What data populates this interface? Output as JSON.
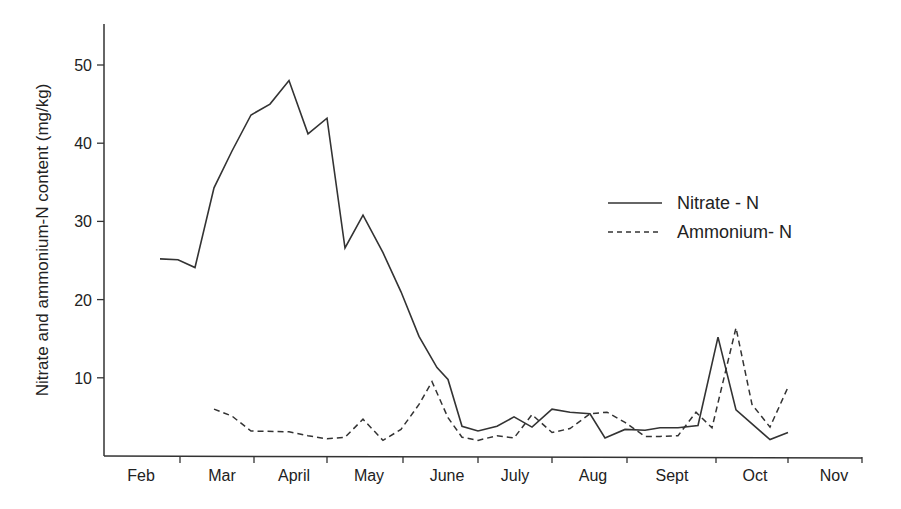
{
  "chart_data": {
    "type": "line",
    "title": "",
    "xlabel": "",
    "ylabel": "Nitrate and ammonium-N content (mg/kg)",
    "ylim": [
      0,
      55
    ],
    "yticks": [
      10,
      20,
      30,
      40,
      50
    ],
    "grid": false,
    "legend_position": "upper right (inside plot)",
    "x_month_labels": [
      "Feb",
      "Mar",
      "April",
      "May",
      "June",
      "July",
      "Aug",
      "Sept",
      "Oct",
      "Nov"
    ],
    "x_month_label_positions_px": [
      141,
      222,
      294,
      369,
      447,
      515,
      593,
      672,
      755,
      834
    ],
    "x_tick_positions_px": [
      180,
      254,
      327,
      403,
      478,
      552,
      627,
      716,
      788,
      862
    ],
    "series": [
      {
        "name": "Nitrate - N",
        "style": "solid",
        "color": "#333333",
        "points_px_x": [
          160,
          178,
          195,
          214,
          232,
          251,
          270,
          289,
          308,
          327,
          345,
          363,
          383,
          401,
          419,
          437,
          448,
          462,
          478,
          497,
          514,
          532,
          552,
          570,
          590,
          605,
          625,
          645,
          660,
          678,
          698,
          718,
          736,
          770,
          788
        ],
        "values": [
          25.2,
          25.1,
          24.1,
          34.3,
          39.0,
          43.6,
          45.0,
          48.0,
          41.2,
          43.2,
          26.6,
          30.8,
          26.0,
          21.0,
          15.3,
          11.3,
          9.8,
          3.8,
          3.2,
          3.8,
          5.0,
          3.7,
          6.0,
          5.6,
          5.4,
          2.3,
          3.4,
          3.3,
          3.6,
          3.6,
          3.9,
          15.2,
          5.9,
          2.1,
          3.0
        ]
      },
      {
        "name": "Ammonium- N",
        "style": "dashed",
        "color": "#333333",
        "points_px_x": [
          214,
          232,
          251,
          289,
          308,
          327,
          345,
          363,
          383,
          401,
          419,
          432,
          448,
          462,
          478,
          497,
          514,
          532,
          552,
          570,
          590,
          607,
          625,
          645,
          660,
          678,
          696,
          712,
          736,
          752,
          770,
          788
        ],
        "values": [
          6.0,
          5.1,
          3.2,
          3.1,
          2.6,
          2.2,
          2.4,
          4.7,
          2.0,
          3.4,
          6.6,
          9.5,
          4.9,
          2.4,
          2.0,
          2.6,
          2.3,
          5.3,
          3.0,
          3.5,
          5.4,
          5.6,
          4.3,
          2.5,
          2.5,
          2.6,
          5.6,
          3.6,
          16.4,
          6.6,
          3.7,
          8.8
        ]
      }
    ]
  },
  "legend": {
    "items": [
      {
        "label": "Nitrate - N",
        "style": "solid"
      },
      {
        "label": "Ammonium- N",
        "style": "dashed"
      }
    ]
  }
}
